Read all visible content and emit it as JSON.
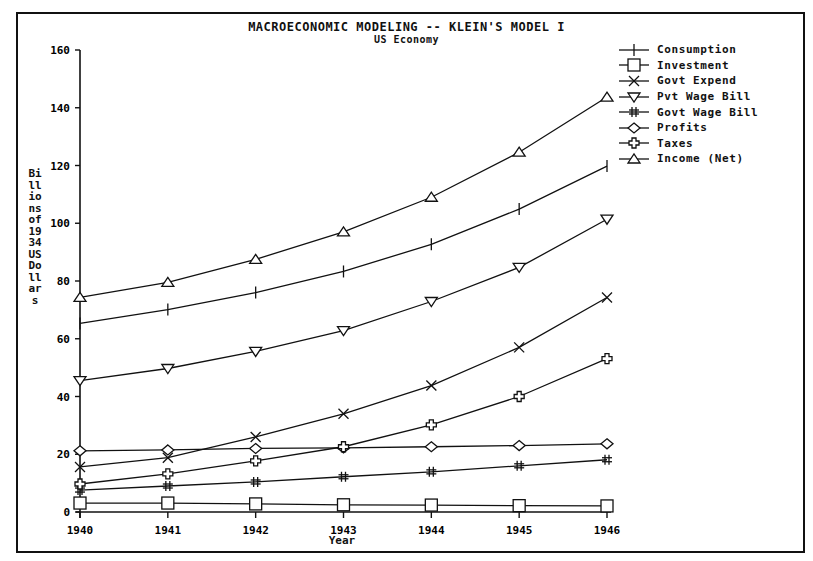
{
  "chart_data": {
    "type": "line",
    "title": "MACROECONOMIC MODELING -- KLEIN'S MODEL I",
    "subtitle": "US Economy",
    "xlabel": "Year",
    "ylabel": "Billions of 1934 US Dollars",
    "x": [
      1940,
      1941,
      1942,
      1943,
      1944,
      1945,
      1946
    ],
    "ylim": [
      0,
      160
    ],
    "yticks": [
      0,
      20,
      40,
      60,
      80,
      100,
      120,
      140,
      160
    ],
    "grid": false,
    "legend_position": "right",
    "series": [
      {
        "name": "Consumption",
        "marker": "plus",
        "values": [
          65.3,
          70.1,
          76.0,
          83.3,
          92.7,
          104.9,
          119.8
        ]
      },
      {
        "name": "Investment",
        "marker": "square",
        "values": [
          3.1,
          3.1,
          2.8,
          2.5,
          2.4,
          2.2,
          2.1
        ]
      },
      {
        "name": "Govt Expend",
        "marker": "x",
        "values": [
          15.6,
          18.8,
          26.0,
          34.0,
          43.8,
          57.0,
          74.3
        ]
      },
      {
        "name": "Pvt Wage Bill",
        "marker": "triangle-down",
        "values": [
          45.5,
          49.7,
          55.6,
          62.8,
          72.9,
          84.7,
          101.4
        ]
      },
      {
        "name": "Govt Wage Bill",
        "marker": "hash",
        "values": [
          7.6,
          9.0,
          10.4,
          12.2,
          13.9,
          16.0,
          18.1
        ]
      },
      {
        "name": "Profits",
        "marker": "diamond",
        "values": [
          21.2,
          21.5,
          22.0,
          22.2,
          22.6,
          23.0,
          23.6
        ]
      },
      {
        "name": "Taxes",
        "marker": "cross-circle",
        "values": [
          9.7,
          13.2,
          17.7,
          22.6,
          30.2,
          40.0,
          53.1
        ]
      },
      {
        "name": "Income (Net)",
        "marker": "triangle-up",
        "values": [
          74.3,
          79.5,
          87.5,
          97.0,
          109.0,
          124.6,
          143.7
        ]
      }
    ]
  },
  "labels": {
    "title": "MACROECONOMIC MODELING -- KLEIN'S MODEL I",
    "subtitle": "US Economy",
    "xlabel": "Year",
    "ylabel": "Billions of 1934 US Dollars"
  }
}
